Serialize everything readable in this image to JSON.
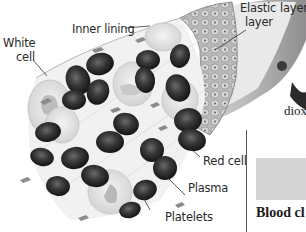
{
  "diagram": {
    "labels": {
      "inner_lining": "Inner lining",
      "white_cell_1": "White",
      "white_cell_2": "cell",
      "elastic_layer_1": "Elastic",
      "elastic_layer_2": "layer",
      "outer_layer_fragment": "layer",
      "red_cell": "Red cell",
      "plasma": "Plasma",
      "platelets": "Platelets"
    },
    "side_text": {
      "fragment": "diox",
      "caption_fragment": "Blood cl"
    },
    "colors": {
      "red_cell": "#2b2b2b",
      "white_cell": "#e8e8e8",
      "vessel_wall": "#9a9a9a",
      "grey_box": "#d4d4d4",
      "text": "#2a2a2a"
    }
  }
}
